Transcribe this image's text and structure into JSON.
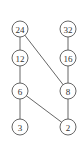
{
  "diagram": {
    "type": "hasse",
    "nodes": [
      {
        "id": "n24",
        "label": "24",
        "x": 20,
        "y": 29
      },
      {
        "id": "n32",
        "label": "32",
        "x": 68,
        "y": 29
      },
      {
        "id": "n12",
        "label": "12",
        "x": 20,
        "y": 58
      },
      {
        "id": "n16",
        "label": "16",
        "x": 68,
        "y": 58
      },
      {
        "id": "n6",
        "label": "6",
        "x": 20,
        "y": 91
      },
      {
        "id": "n8",
        "label": "8",
        "x": 68,
        "y": 91
      },
      {
        "id": "n3",
        "label": "3",
        "x": 20,
        "y": 127
      },
      {
        "id": "n2",
        "label": "2",
        "x": 68,
        "y": 127
      }
    ],
    "edges": [
      [
        "24",
        "12"
      ],
      [
        "24",
        "8"
      ],
      [
        "32",
        "16"
      ],
      [
        "16",
        "8"
      ],
      [
        "12",
        "6"
      ],
      [
        "6",
        "3"
      ],
      [
        "6",
        "2"
      ],
      [
        "8",
        "2"
      ]
    ]
  }
}
